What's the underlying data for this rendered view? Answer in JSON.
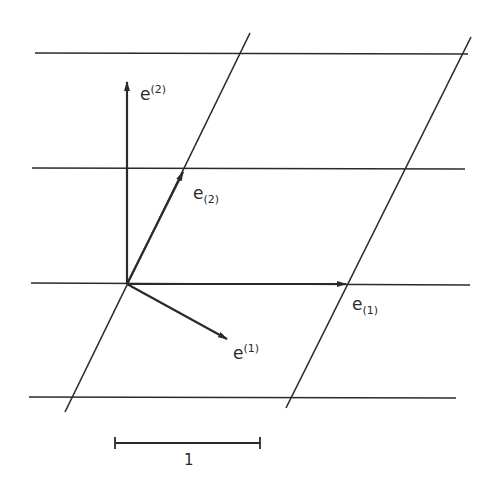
{
  "diagram": {
    "title": "",
    "colors": {
      "ink": "#2a2a2a",
      "background": "#ffffff"
    },
    "labels": {
      "e_sup_2": {
        "base": "e",
        "index": "(2)",
        "position": "superscript"
      },
      "e_sub_2": {
        "base": "e",
        "index": "(2)",
        "position": "subscript"
      },
      "e_sub_1": {
        "base": "e",
        "index": "(1)",
        "position": "subscript"
      },
      "e_sup_1": {
        "base": "e",
        "index": "(1)",
        "position": "superscript"
      }
    },
    "scale_bar": {
      "label": "1"
    },
    "elements": {
      "horizontal_lattice_lines": 4,
      "slanted_lattice_lines": 2,
      "vectors": [
        "e^(2)",
        "e_(2)",
        "e_(1)",
        "e^(1)"
      ]
    }
  }
}
